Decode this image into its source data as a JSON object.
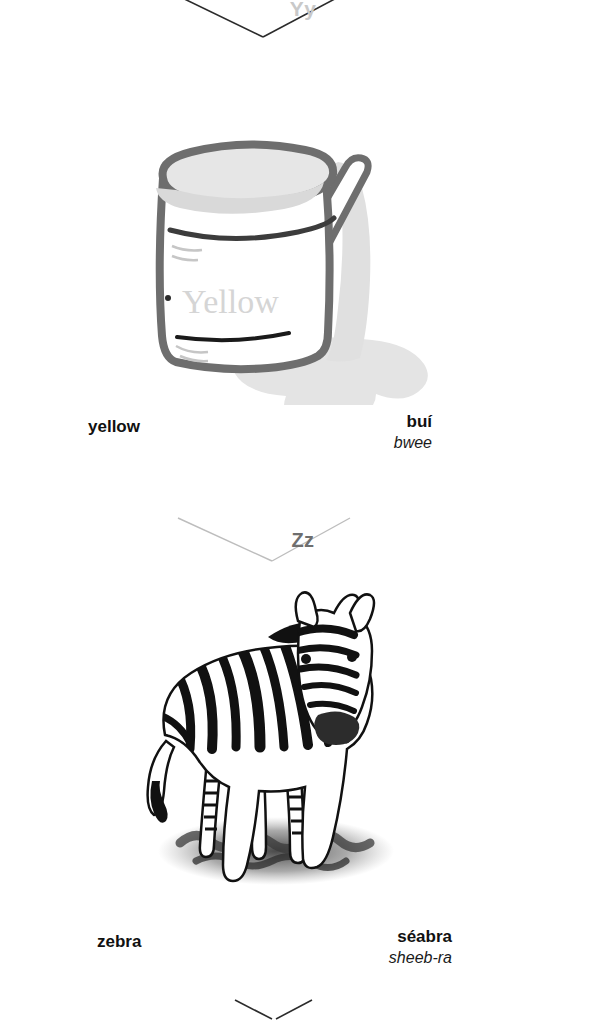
{
  "page": {
    "background_color": "#ffffff",
    "type": "picture-dictionary-page",
    "language_pair": "English – Irish"
  },
  "dividers": [
    {
      "name": "yy",
      "letter": "Yy",
      "color": "#c9c9c9"
    },
    {
      "name": "zz",
      "letter": "Zz",
      "color": "#6e6e6e"
    },
    {
      "name": "bottom",
      "letter": "",
      "color": "#222222"
    }
  ],
  "entries": [
    {
      "id": "yellow",
      "illustration": {
        "name": "paint-can-illustration",
        "label_text": "Yellow",
        "description": "open paint can with stirring stick and spilled paint puddle",
        "outline_color": "#6b6b6b",
        "paint_color": "#e3e3e3",
        "label_color": "#d8d8d8"
      },
      "english": "yellow",
      "irish": "buí",
      "pronunciation": "bwee"
    },
    {
      "id": "zebra",
      "illustration": {
        "name": "zebra-illustration",
        "description": "black and white striped zebra standing facing forward on shaded ground",
        "stripe_color": "#111111",
        "ground_color": "#4a4a4a"
      },
      "english": "zebra",
      "irish": "séabra",
      "pronunciation": "sheeb-ra"
    }
  ]
}
